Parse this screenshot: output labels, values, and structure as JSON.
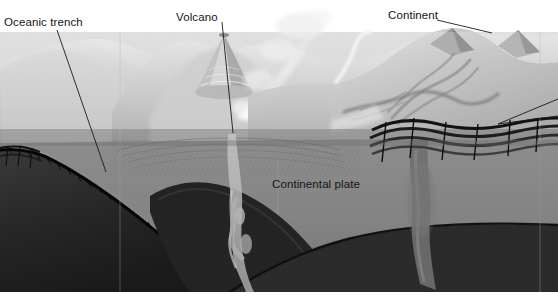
{
  "figure": {
    "width": 558,
    "height": 301,
    "background_color": "#ffffff",
    "style": "grayscale airbrushed geological block diagram"
  },
  "labels": {
    "oceanic_trench": "Oceanic trench",
    "volcano": "Volcano",
    "continent": "Continent",
    "continental_plate": "Continental plate"
  },
  "leader_lines": [
    {
      "name": "oceanic-trench-leader",
      "from": [
        57,
        30
      ],
      "to": [
        106,
        172
      ]
    },
    {
      "name": "volcano-leader",
      "from": [
        222,
        22
      ],
      "to": [
        232,
        133
      ]
    },
    {
      "name": "continent-leader",
      "from": [
        437,
        20
      ],
      "to": [
        492,
        32
      ]
    },
    {
      "name": "right-edge-leader-upper",
      "from": [
        558,
        99
      ],
      "to": [
        500,
        122
      ]
    },
    {
      "name": "right-edge-leader-lower",
      "from": [
        558,
        115
      ],
      "to": [
        500,
        122
      ]
    }
  ],
  "features": {
    "sky_band": {
      "name": "sky",
      "color": "#ffffff",
      "y_range": [
        0,
        32
      ]
    },
    "sea_surface": {
      "name": "sea-surface-band",
      "color": "#d3d3d3",
      "y_range": [
        32,
        129
      ]
    },
    "water_column": {
      "name": "deeper-water-band",
      "color": "#9e9e9e",
      "y_range": [
        129,
        140
      ]
    },
    "continental_plate_body": {
      "name": "continental-plate",
      "color": "#838383"
    },
    "oceanic_plate_slab": {
      "name": "subducting-oceanic-slab",
      "color": "#2b2b2b"
    },
    "mantle": {
      "name": "mantle",
      "color": "#1d1d1d"
    },
    "magma_conduit": {
      "name": "magma-conduit",
      "color": "#b9b9b9"
    },
    "eruption_plume": {
      "name": "eruption-plume",
      "color": "#f2f2f2"
    },
    "sediment_layers": {
      "name": "folded-sediment-layers",
      "color": "#141414"
    },
    "bottom_margin": {
      "name": "bottom-white-margin",
      "color": "#ffffff",
      "y_range": [
        292,
        301
      ]
    }
  },
  "colors": {
    "ink": "#151515",
    "paper": "#ffffff",
    "light_terrain": "#d8d8d8",
    "mid_gray": "#868686",
    "dark_gray": "#2c2c2c",
    "near_black": "#171717"
  }
}
